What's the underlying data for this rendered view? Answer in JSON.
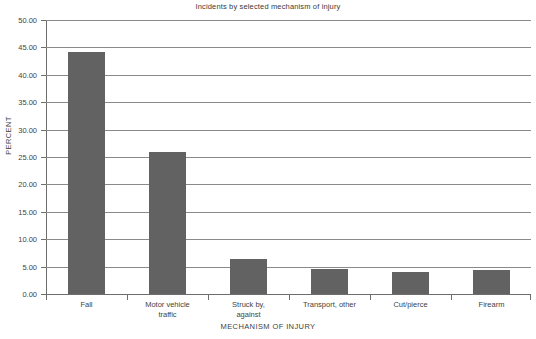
{
  "chart_data": {
    "type": "bar",
    "title": "Incidents by selected mechanism of injury",
    "xlabel": "MECHANISM OF INJURY",
    "ylabel": "PERCENT",
    "categories": [
      "Fall",
      "Motor vehicle traffic",
      "Struck by, against",
      "Transport, other",
      "Cut/pierce",
      "Firearm"
    ],
    "category_lines": [
      [
        "Fall"
      ],
      [
        "Motor vehicle",
        "traffic"
      ],
      [
        "Struck by,",
        "against"
      ],
      [
        "Transport, other"
      ],
      [
        "Cut/pierce"
      ],
      [
        "Firearm"
      ]
    ],
    "values": [
      44.2,
      26.0,
      6.4,
      4.6,
      4.1,
      4.3
    ],
    "ylim": [
      0,
      50
    ],
    "ytick_values": [
      0,
      5,
      10,
      15,
      20,
      25,
      30,
      35,
      40,
      45,
      50
    ],
    "ytick_labels": [
      "0.00",
      "5.00",
      "10.00",
      "15.00",
      "20.00",
      "25.00",
      "30.00",
      "35.00",
      "40.00",
      "45.00",
      "50.00"
    ],
    "grid": true,
    "legend": false,
    "bar_color": "#626262",
    "grid_color": "#8a8a8a",
    "axis_color": "#6d6d6d",
    "text_color": "#3f3f3f"
  }
}
